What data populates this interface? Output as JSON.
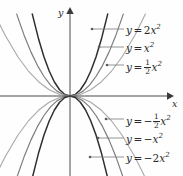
{
  "figure": {
    "background_color": "#fefefe",
    "axis_color": "#4a4a4a",
    "text_color": "#2b2b2b",
    "origin": {
      "x": 70,
      "y": 96
    },
    "axes": {
      "x_label": "x",
      "y_label": "y"
    }
  },
  "chart_data": {
    "type": "line",
    "title": "",
    "xlabel": "x",
    "ylabel": "y",
    "grid": false,
    "legend_position": "inline-annotations",
    "xlim": [
      -3.5,
      3.5
    ],
    "ylim": [
      -4.2,
      4.2
    ],
    "series": [
      {
        "name": "y = 2x^2",
        "label_text": "y = 2x²",
        "coefficient": 2,
        "color": "#2f2f2f",
        "width": 1.5,
        "x": [
          -1.45,
          -1.2,
          -1.0,
          -0.8,
          -0.6,
          -0.4,
          -0.2,
          0,
          0.2,
          0.4,
          0.6,
          0.8,
          1.0,
          1.2,
          1.45
        ],
        "y": [
          4.2,
          2.88,
          2.0,
          1.28,
          0.72,
          0.32,
          0.08,
          0,
          0.08,
          0.32,
          0.72,
          1.28,
          2.0,
          2.88,
          4.2
        ]
      },
      {
        "name": "y = x^2",
        "label_text": "y = x²",
        "coefficient": 1,
        "color": "#7d7d7d",
        "width": 1.2,
        "x": [
          -2.05,
          -1.75,
          -1.5,
          -1.25,
          -1.0,
          -0.75,
          -0.5,
          -0.25,
          0,
          0.25,
          0.5,
          0.75,
          1.0,
          1.25,
          1.5,
          1.75,
          2.05
        ],
        "y": [
          4.2,
          3.06,
          2.25,
          1.56,
          1.0,
          0.56,
          0.25,
          0.06,
          0,
          0.06,
          0.25,
          0.56,
          1.0,
          1.56,
          2.25,
          3.06,
          4.2
        ]
      },
      {
        "name": "y = 1/2 x^2",
        "label_text": "y = ½x²",
        "coefficient": 0.5,
        "color": "#a8a8a8",
        "width": 1.1,
        "x": [
          -2.9,
          -2.5,
          -2.0,
          -1.6,
          -1.2,
          -0.8,
          -0.4,
          0,
          0.4,
          0.8,
          1.2,
          1.6,
          2.0,
          2.5,
          2.9
        ],
        "y": [
          4.2,
          3.13,
          2.0,
          1.28,
          0.72,
          0.32,
          0.08,
          0,
          0.08,
          0.32,
          0.72,
          1.28,
          2.0,
          3.13,
          4.2
        ]
      },
      {
        "name": "y = -1/2 x^2",
        "label_text": "y = −½x²",
        "coefficient": -0.5,
        "color": "#a8a8a8",
        "width": 1.1,
        "x": [
          -2.9,
          -2.5,
          -2.0,
          -1.6,
          -1.2,
          -0.8,
          -0.4,
          0,
          0.4,
          0.8,
          1.2,
          1.6,
          2.0,
          2.5,
          2.9
        ],
        "y": [
          -4.2,
          -3.13,
          -2.0,
          -1.28,
          -0.72,
          -0.32,
          -0.08,
          0,
          -0.08,
          -0.32,
          -0.72,
          -1.28,
          -2.0,
          -3.13,
          -4.2
        ]
      },
      {
        "name": "y = -x^2",
        "label_text": "y = −x²",
        "coefficient": -1,
        "color": "#7d7d7d",
        "width": 1.2,
        "x": [
          -2.05,
          -1.75,
          -1.5,
          -1.25,
          -1.0,
          -0.75,
          -0.5,
          -0.25,
          0,
          0.25,
          0.5,
          0.75,
          1.0,
          1.25,
          1.5,
          1.75,
          2.05
        ],
        "y": [
          -4.2,
          -3.06,
          -2.25,
          -1.56,
          -1.0,
          -0.56,
          -0.25,
          -0.06,
          0,
          -0.06,
          -0.25,
          -0.56,
          -1.0,
          -1.56,
          -2.25,
          -3.06,
          -4.2
        ]
      },
      {
        "name": "y = -2x^2",
        "label_text": "y = −2x²",
        "coefficient": -2,
        "color": "#2f2f2f",
        "width": 1.5,
        "x": [
          -1.45,
          -1.2,
          -1.0,
          -0.8,
          -0.6,
          -0.4,
          -0.2,
          0,
          0.2,
          0.4,
          0.6,
          0.8,
          1.0,
          1.2,
          1.45
        ],
        "y": [
          -4.2,
          -2.88,
          -2.0,
          -1.28,
          -0.72,
          -0.32,
          -0.08,
          0,
          -0.08,
          -0.32,
          -0.72,
          -1.28,
          -2.0,
          -2.88,
          -4.2
        ]
      }
    ]
  },
  "annotations": [
    {
      "id": "label-2x2",
      "prefix": "y",
      "equals": "=",
      "coefficient": "2",
      "variable": "x",
      "exponent": "2",
      "negative": "",
      "fraction": null,
      "label_x": 126,
      "label_y": 24,
      "leader_from_x": 92,
      "leader_to_x": 124,
      "leader_y": 29
    },
    {
      "id": "label-x2",
      "prefix": "y",
      "equals": "=",
      "coefficient": "",
      "variable": "x",
      "exponent": "2",
      "negative": "",
      "fraction": null,
      "label_x": 126,
      "label_y": 42,
      "leader_from_x": 99,
      "leader_to_x": 124,
      "leader_y": 47
    },
    {
      "id": "label-half-x2",
      "prefix": "y",
      "equals": "=",
      "coefficient": "",
      "variable": "x",
      "exponent": "2",
      "negative": "",
      "fraction": {
        "num": "1",
        "den": "2"
      },
      "label_x": 126,
      "label_y": 59,
      "leader_from_x": 107,
      "leader_to_x": 124,
      "leader_y": 65
    },
    {
      "id": "label-neg-half-x2",
      "prefix": "y",
      "equals": "=",
      "coefficient": "",
      "variable": "x",
      "exponent": "2",
      "negative": "−",
      "fraction": {
        "num": "1",
        "den": "2"
      },
      "label_x": 126,
      "label_y": 113,
      "leader_from_x": 106,
      "leader_to_x": 124,
      "leader_y": 119
    },
    {
      "id": "label-neg-x2",
      "prefix": "y",
      "equals": "=",
      "coefficient": "",
      "variable": "x",
      "exponent": "2",
      "negative": "−",
      "fraction": null,
      "label_x": 126,
      "label_y": 133,
      "leader_from_x": 98,
      "leader_to_x": 124,
      "leader_y": 138
    },
    {
      "id": "label-neg-2x2",
      "prefix": "y",
      "equals": "=",
      "coefficient": "2",
      "variable": "x",
      "exponent": "2",
      "negative": "−",
      "fraction": null,
      "label_x": 126,
      "label_y": 152,
      "leader_from_x": 90,
      "leader_to_x": 124,
      "leader_y": 157
    }
  ]
}
